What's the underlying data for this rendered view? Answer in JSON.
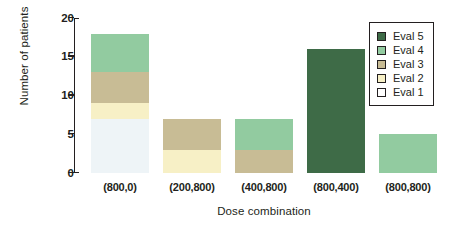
{
  "chart_data": {
    "type": "bar",
    "stacked": true,
    "title": "",
    "xlabel": "Dose combination",
    "ylabel": "Number of patients",
    "categories": [
      "(800,0)",
      "(200,800)",
      "(400,800)",
      "(800,400)",
      "(800,800)"
    ],
    "ylim": [
      0,
      20
    ],
    "yticks": [
      0,
      5,
      10,
      15,
      20
    ],
    "ytick_labels": [
      "0",
      "5",
      "10",
      "15",
      "20"
    ],
    "grid": false,
    "legend_position": "top-right",
    "series": [
      {
        "name": "Eval 1",
        "color": "#eef4f7",
        "values": [
          7,
          0,
          0,
          0,
          0
        ]
      },
      {
        "name": "Eval 2",
        "color": "#f7f0c6",
        "values": [
          2,
          3,
          0,
          0,
          0
        ]
      },
      {
        "name": "Eval 3",
        "color": "#c8bc95",
        "values": [
          4,
          4,
          3,
          0,
          0
        ]
      },
      {
        "name": "Eval 4",
        "color": "#92cba0",
        "values": [
          5,
          0,
          4,
          0,
          5
        ]
      },
      {
        "name": "Eval 5",
        "color": "#3e6b47",
        "values": [
          0,
          0,
          0,
          16,
          0
        ]
      }
    ],
    "totals": [
      18,
      7,
      7,
      16,
      5
    ],
    "legend_order": [
      "Eval 5",
      "Eval 4",
      "Eval 3",
      "Eval 2",
      "Eval 1"
    ]
  },
  "legend": {
    "items": [
      {
        "label": "Eval 5",
        "color": "#3e6b47"
      },
      {
        "label": "Eval 4",
        "color": "#92cba0"
      },
      {
        "label": "Eval 3",
        "color": "#c8bc95"
      },
      {
        "label": "Eval 2",
        "color": "#f7f0c6"
      },
      {
        "label": "Eval 1",
        "color": "#ffffff"
      }
    ]
  },
  "axes": {
    "y_title": "Number of patients",
    "x_title": "Dose combination",
    "axis_color": "#231f20"
  }
}
